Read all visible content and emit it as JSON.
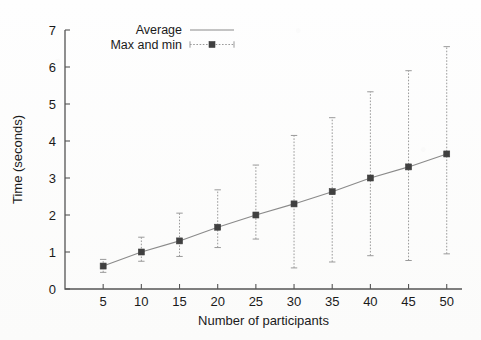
{
  "chart_data": {
    "type": "line",
    "title": "",
    "subtitle": "",
    "xlabel": "Number of participants",
    "ylabel": "Time (seconds)",
    "xlim": [
      0,
      52
    ],
    "ylim": [
      0,
      7
    ],
    "grid": false,
    "legend_position": "top-left",
    "x_ticks": [
      5,
      10,
      15,
      20,
      25,
      30,
      35,
      40,
      45,
      50
    ],
    "y_ticks": [
      0,
      1,
      2,
      3,
      4,
      5,
      6,
      7
    ],
    "x": [
      5,
      10,
      15,
      20,
      25,
      30,
      35,
      40,
      45,
      50
    ],
    "series": [
      {
        "name": "Average",
        "style": "line",
        "values": [
          0.62,
          1.0,
          1.3,
          1.67,
          2.0,
          2.3,
          2.63,
          3.0,
          3.3,
          3.65
        ]
      },
      {
        "name": "Max and min",
        "style": "errorbar",
        "min": [
          0.45,
          0.75,
          0.88,
          1.12,
          1.35,
          0.57,
          0.73,
          0.9,
          0.77,
          0.95
        ],
        "max": [
          0.8,
          1.4,
          2.05,
          2.68,
          3.35,
          4.15,
          4.63,
          5.33,
          5.9,
          6.55
        ]
      }
    ],
    "annotations": []
  },
  "legend": {
    "entries": [
      {
        "label": "Average",
        "marker": "solid-line"
      },
      {
        "label": "Max and min",
        "marker": "errorbar-cross"
      }
    ]
  },
  "colors": {
    "ink": "#1a1a1a",
    "line": "#8a8a8a",
    "errorbar": "#9a9a9a",
    "marker": "#404040",
    "axis": "#555555",
    "background": "#fdfdfc"
  }
}
